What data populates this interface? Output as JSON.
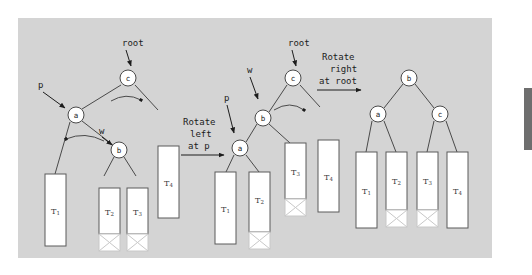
{
  "figure": {
    "panel_bg": "#d4d4d4",
    "node_fill": "#ffffff",
    "node_stroke": "#4a4a4a",
    "box_fill": "#ffffff",
    "box_stroke": "#5a5a5a",
    "dead_box_stroke": "#c8c8c8",
    "line_color": "#4a4a4a"
  },
  "trees": [
    {
      "id": "tree-before",
      "nodes": [
        {
          "key": "c",
          "x": 128,
          "y": 78
        },
        {
          "key": "a",
          "x": 76,
          "y": 115
        },
        {
          "key": "b",
          "x": 119,
          "y": 150
        }
      ],
      "subtrees": [
        {
          "key": "T",
          "sub": "1",
          "x": 55,
          "y": 174,
          "w": 21,
          "h": 72,
          "dead": false
        },
        {
          "key": "T",
          "sub": "2",
          "x": 99,
          "y": 188,
          "w": 21,
          "h": 46,
          "dead": false
        },
        {
          "key": "T",
          "sub": "3",
          "x": 127,
          "y": 188,
          "w": 21,
          "h": 46,
          "dead": false
        },
        {
          "key": "T",
          "sub": "4",
          "x": 158,
          "y": 146,
          "w": 21,
          "h": 72,
          "dead": false
        }
      ],
      "dead_boxes": [
        {
          "x": 99,
          "y": 234,
          "w": 21,
          "h": 17
        },
        {
          "x": 127,
          "y": 234,
          "w": 21,
          "h": 17
        }
      ],
      "pointer_labels": [
        {
          "text": "root",
          "x": 122,
          "y": 43
        },
        {
          "text": "p",
          "x": 42,
          "y": 85
        },
        {
          "text": "w",
          "x": 102,
          "y": 131
        }
      ]
    },
    {
      "id": "tree-middle",
      "nodes": [
        {
          "key": "c",
          "x": 293,
          "y": 78
        },
        {
          "key": "b",
          "x": 263,
          "y": 118
        },
        {
          "key": "a",
          "x": 240,
          "y": 148
        },
        {
          "key": "T3-anchor",
          "x": 0,
          "y": 0
        }
      ],
      "subtrees": [
        {
          "key": "T",
          "sub": "1",
          "x": 219,
          "y": 172,
          "w": 21,
          "h": 72,
          "dead": false
        },
        {
          "key": "T",
          "sub": "2",
          "x": 253,
          "y": 172,
          "w": 21,
          "h": 60,
          "dead": false
        },
        {
          "key": "T",
          "sub": "3",
          "x": 285,
          "y": 143,
          "w": 21,
          "h": 56,
          "dead": false
        },
        {
          "key": "T",
          "sub": "4",
          "x": 318,
          "y": 140,
          "w": 21,
          "h": 72,
          "dead": false
        }
      ],
      "dead_boxes": [
        {
          "x": 253,
          "y": 232,
          "w": 21,
          "h": 17
        },
        {
          "x": 285,
          "y": 199,
          "w": 21,
          "h": 17
        }
      ],
      "pointer_labels": [
        {
          "text": "root",
          "x": 288,
          "y": 43
        },
        {
          "text": "w",
          "x": 250,
          "y": 70
        },
        {
          "text": "p",
          "x": 226,
          "y": 98
        }
      ]
    },
    {
      "id": "tree-after",
      "nodes": [
        {
          "key": "b",
          "x": 409,
          "y": 78
        },
        {
          "key": "a",
          "x": 378,
          "y": 114
        },
        {
          "key": "c",
          "x": 440,
          "y": 114
        }
      ],
      "subtrees": [
        {
          "key": "T",
          "sub": "1",
          "x": 356,
          "y": 152,
          "w": 21,
          "h": 76,
          "dead": false
        },
        {
          "key": "T",
          "sub": "2",
          "x": 386,
          "y": 152,
          "w": 21,
          "h": 58,
          "dead": false
        },
        {
          "key": "T",
          "sub": "3",
          "x": 417,
          "y": 152,
          "w": 21,
          "h": 58,
          "dead": false
        },
        {
          "key": "T",
          "sub": "4",
          "x": 447,
          "y": 152,
          "w": 21,
          "h": 76,
          "dead": false
        }
      ],
      "dead_boxes": [
        {
          "x": 386,
          "y": 210,
          "w": 21,
          "h": 17
        },
        {
          "x": 417,
          "y": 210,
          "w": 21,
          "h": 17
        }
      ],
      "pointer_labels": []
    }
  ],
  "operations": [
    {
      "id": "rotate-left-at-p",
      "lines": [
        "Rotate",
        "left",
        "at p"
      ],
      "x": 210,
      "y": 122,
      "arrow": {
        "x1": 181,
        "y1": 153,
        "x2": 223,
        "y2": 153
      }
    },
    {
      "id": "rotate-right-at-root",
      "lines": [
        "Rotate",
        "right",
        "at root"
      ],
      "x": 348,
      "y": 57,
      "arrow": {
        "x1": 317,
        "y1": 88,
        "x2": 360,
        "y2": 88
      }
    }
  ],
  "scrollbar": {
    "name": "vertical-scrollbar-thumb",
    "color": "#6e6e6e"
  }
}
